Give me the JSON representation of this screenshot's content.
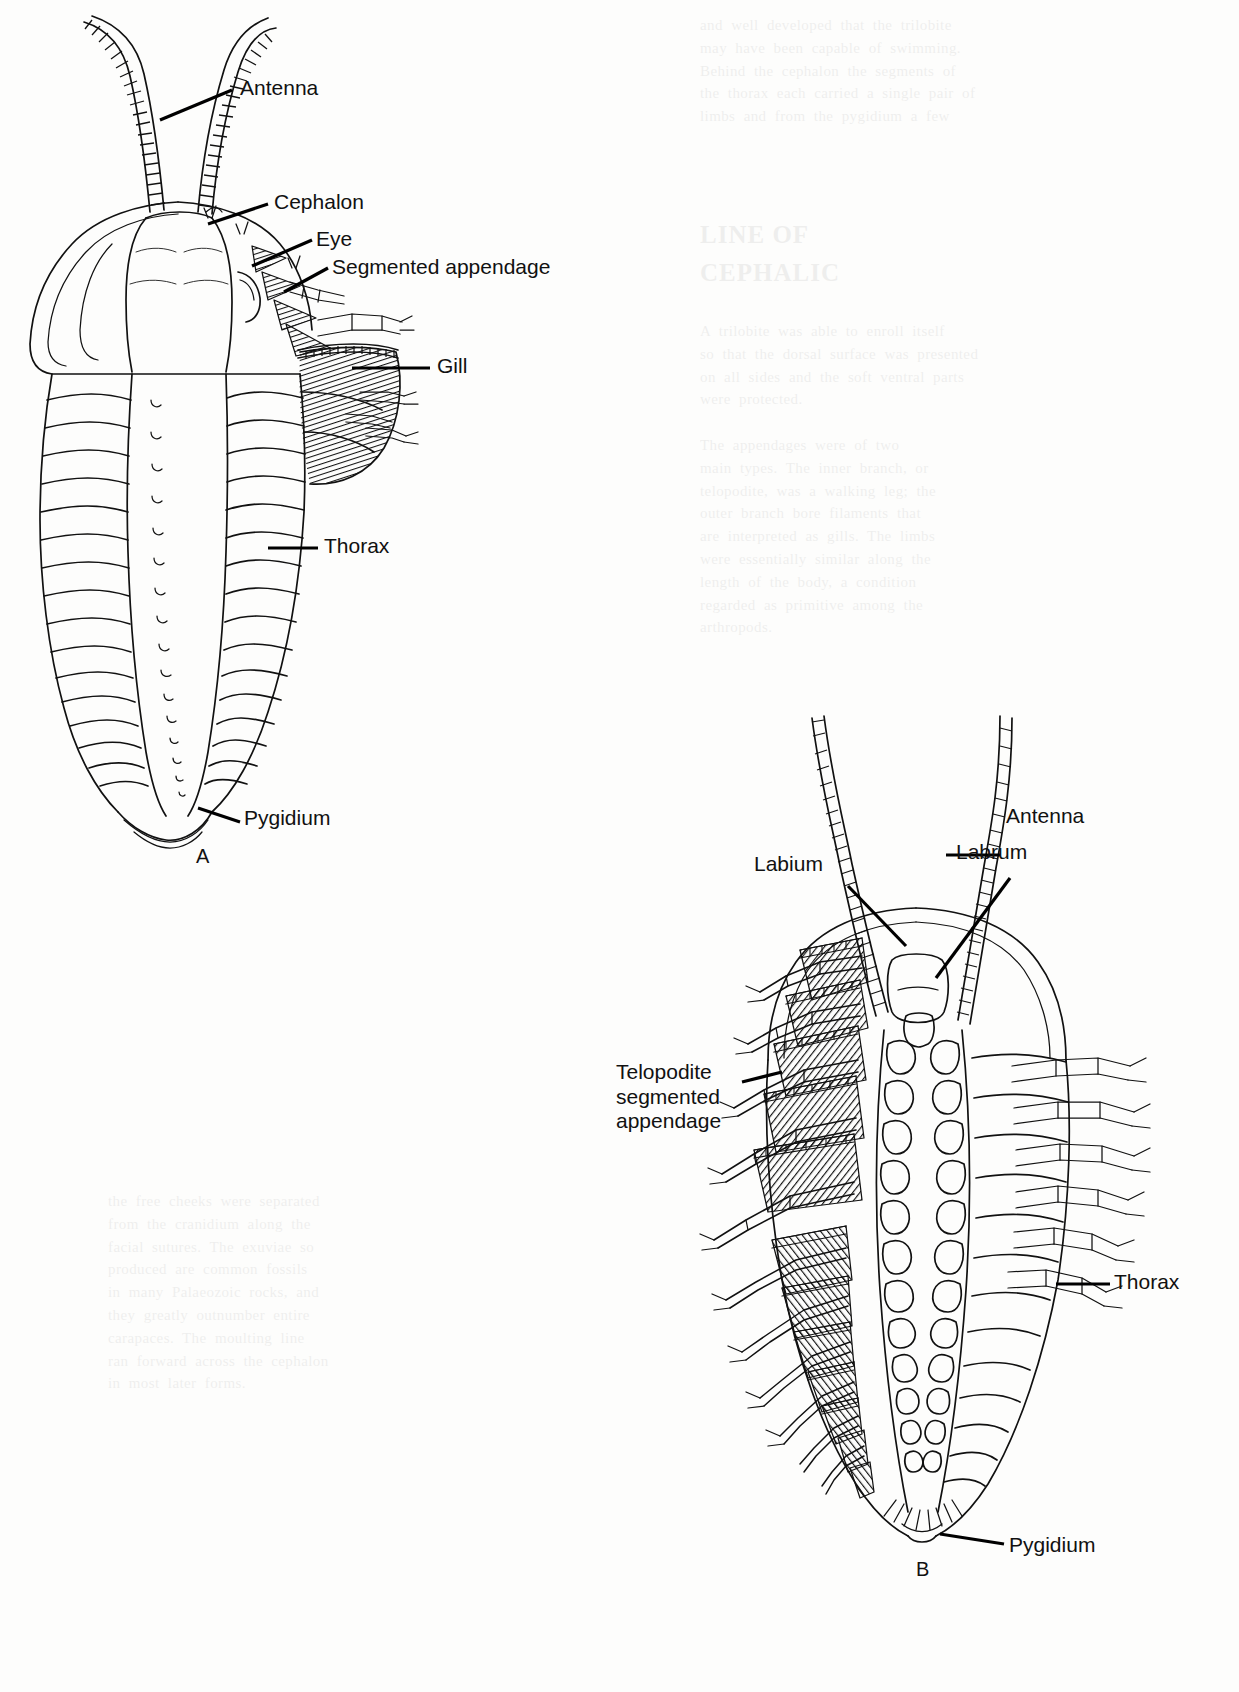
{
  "figure": {
    "panels": [
      {
        "letter": "A",
        "view": "dorsal",
        "labels": [
          {
            "id": "antenna",
            "text": "Antenna"
          },
          {
            "id": "cephalon",
            "text": "Cephalon"
          },
          {
            "id": "eye",
            "text": "Eye"
          },
          {
            "id": "segmented-appendage",
            "text": "Segmented appendage"
          },
          {
            "id": "gill",
            "text": "Gill"
          },
          {
            "id": "thorax",
            "text": "Thorax"
          },
          {
            "id": "pygidium",
            "text": "Pygidium"
          }
        ]
      },
      {
        "letter": "B",
        "view": "ventral",
        "labels": [
          {
            "id": "antenna",
            "text": "Antenna"
          },
          {
            "id": "labium",
            "text": "Labium"
          },
          {
            "id": "labrum",
            "text": "Labrum"
          },
          {
            "id": "telopodite",
            "text": "Telopodite\nsegmented\nappendage"
          },
          {
            "id": "thorax",
            "text": "Thorax"
          },
          {
            "id": "pygidium",
            "text": "Pygidium"
          }
        ]
      }
    ]
  },
  "bleed_text": {
    "heading": "LINE OF\nCEPHALIC",
    "col_top": "and  well  developed  that  the  trilobite\nmay  have  been  capable  of  swimming.\nBehind  the  cephalon  the  segments  of\nthe  thorax  each  carried  a  single  pair  of\nlimbs  and  from  the  pygidium  a  few",
    "col_body": "A  trilobite  was  able  to  enroll  itself\nso  that  the  dorsal  surface  was  presented\non  all  sides  and  the  soft  ventral  parts\nwere  protected.\n\nThe  appendages  were  of  two\nmain  types.  The  inner  branch,  or\ntelopodite,  was  a  walking  leg;  the\nouter  branch  bore  filaments  that\nare  interpreted  as  gills.  The  limbs\nwere  essentially  similar  along  the\nlength  of  the  body,  a  condition\nregarded  as  primitive  among  the\narthropods.",
    "left_col": "the  free  cheeks  were  separated\nfrom  the  cranidium  along  the\nfacial  sutures.  The  exuviae  so\nproduced  are  common  fossils\nin  many  Palaeozoic  rocks,  and\nthey  greatly  outnumber  entire\ncarapaces.  The  moulting  line\nran  forward  across  the  cephalon\nin  most  later  forms."
  }
}
